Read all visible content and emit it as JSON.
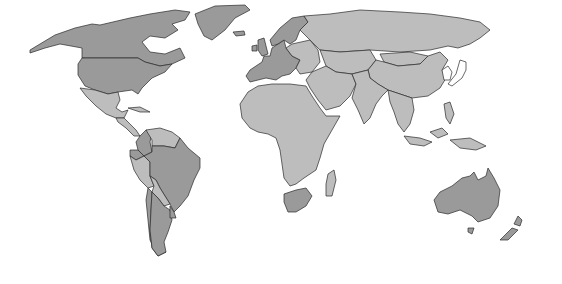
{
  "map": {
    "type": "choropleth",
    "projection": "robinson-like world",
    "title": "",
    "legend": null,
    "colors": {
      "high": "#9a9a9a",
      "low": "#bdbdbd",
      "none": "#ffffff",
      "border": "#2a2a2a",
      "ocean": "#ffffff"
    },
    "categories": [
      {
        "key": "high",
        "regions": [
          "Canada",
          "United States",
          "Greenland",
          "United Kingdom",
          "Ireland",
          "France",
          "Spain",
          "Portugal",
          "Germany",
          "Netherlands",
          "Belgium",
          "Norway",
          "Sweden",
          "Finland",
          "Denmark",
          "Italy",
          "Austria",
          "Switzerland",
          "Iceland",
          "Colombia",
          "Ecuador",
          "Brazil",
          "Argentina",
          "Chile",
          "Uruguay",
          "South Africa",
          "Australia",
          "New Zealand"
        ]
      },
      {
        "key": "low",
        "regions": [
          "Mexico",
          "Central America",
          "Venezuela",
          "Guyana",
          "Suriname",
          "Peru",
          "Bolivia",
          "Paraguay",
          "Africa (excl. South Africa)",
          "Madagascar",
          "Eastern Europe",
          "Russia",
          "Middle East",
          "Central Asia",
          "India",
          "China",
          "Mongolia",
          "Southeast Asia",
          "Indonesia",
          "Papua New Guinea",
          "Philippines"
        ]
      },
      {
        "key": "none",
        "regions": [
          "Japan",
          "North Korea",
          "South Korea",
          "Antarctica"
        ]
      }
    ]
  }
}
